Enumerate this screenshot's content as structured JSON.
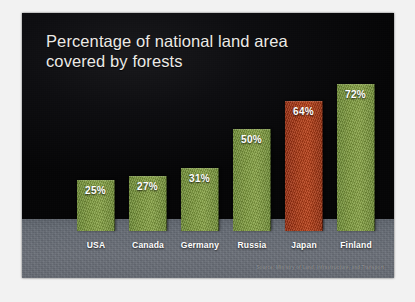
{
  "slide": {
    "title": "Percentage of national land area\ncovered by forests",
    "source_note": "Source: Ministry of Land, Infrastructure, and Transport",
    "background_sky_color": "#0a0a0c",
    "background_ground_color": "#666c75"
  },
  "chart_data": {
    "type": "bar",
    "title": "Percentage of national land area covered by forests",
    "xlabel": "",
    "ylabel": "",
    "ylim": [
      0,
      80
    ],
    "grid": false,
    "legend": "none",
    "categories": [
      "USA",
      "Canada",
      "Germany",
      "Russia",
      "Japan",
      "Finland"
    ],
    "values": [
      25,
      27,
      31,
      50,
      64,
      72
    ],
    "value_labels": [
      "25%",
      "27%",
      "31%",
      "50%",
      "64%",
      "72%"
    ],
    "bar_colors": [
      "#7d9a3c",
      "#7d9a3c",
      "#7d9a3c",
      "#7d9a3c",
      "#ad3914",
      "#7d9a3c"
    ],
    "highlight_category": "Japan",
    "highlight_color": "#ad3914",
    "series_color": "#7d9a3c"
  }
}
